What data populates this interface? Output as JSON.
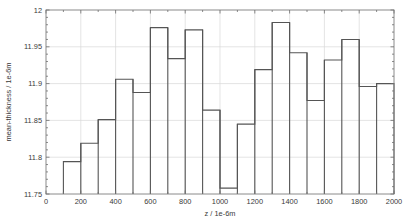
{
  "chart_data": {
    "type": "bar",
    "title": "",
    "subtitle": "",
    "xlabel": "z / 1e-6m",
    "ylabel": "mean-thickness / 1e-6m",
    "xlim": [
      0,
      2000
    ],
    "ylim": [
      11.75,
      12
    ],
    "grid": true,
    "legend": null,
    "bin_width": 100,
    "categories": [
      "100-200",
      "200-300",
      "300-400",
      "400-500",
      "500-600",
      "600-700",
      "700-800",
      "800-900",
      "900-1000",
      "1000-1100",
      "1100-1200",
      "1200-1300",
      "1300-1400",
      "1400-1500",
      "1500-1600",
      "1600-1700",
      "1700-1800",
      "1800-1900",
      "1900-2000"
    ],
    "bin_edges": [
      100,
      200,
      300,
      400,
      500,
      600,
      700,
      800,
      900,
      1000,
      1100,
      1200,
      1300,
      1400,
      1500,
      1600,
      1700,
      1800,
      1900,
      2000
    ],
    "values": [
      11.794,
      11.819,
      11.851,
      11.906,
      11.888,
      11.976,
      11.934,
      11.973,
      11.864,
      11.758,
      11.845,
      11.919,
      11.983,
      11.942,
      11.877,
      11.932,
      11.96,
      11.896,
      11.9
    ],
    "x_ticks": [
      0,
      200,
      400,
      600,
      800,
      1000,
      1200,
      1400,
      1600,
      1800,
      2000
    ],
    "x_tick_labels": [
      "0",
      "200",
      "400",
      "600",
      "800",
      "1000",
      "1200",
      "1400",
      "1600",
      "1800",
      "2000"
    ],
    "y_ticks": [
      11.75,
      11.8,
      11.85,
      11.9,
      11.95,
      12
    ],
    "y_tick_labels": [
      "11.75",
      "11.8",
      "11.85",
      "11.9",
      "11.95",
      "12"
    ],
    "colors": {
      "bar_stroke": "#555555",
      "bar_fill": "none",
      "grid": "#d9d9d9",
      "axis": "#8a8a8a",
      "text": "#3a3a3a",
      "background": "#ffffff"
    }
  }
}
